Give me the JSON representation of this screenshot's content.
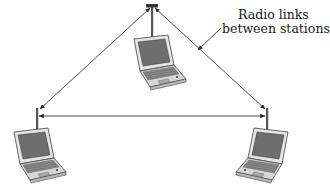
{
  "diagram": {
    "type": "ad-hoc wireless network",
    "callout": {
      "line1": "Radio links",
      "line2": "between stations"
    },
    "nodes": [
      {
        "id": "station-top",
        "label": "",
        "icon": "laptop-with-antenna"
      },
      {
        "id": "station-left",
        "label": "",
        "icon": "laptop-with-antenna"
      },
      {
        "id": "station-right",
        "label": "",
        "icon": "laptop-with-antenna"
      }
    ],
    "edges": [
      {
        "from": "station-top",
        "to": "station-left",
        "style": "double-arrow"
      },
      {
        "from": "station-top",
        "to": "station-right",
        "style": "double-arrow"
      },
      {
        "from": "station-left",
        "to": "station-right",
        "style": "double-arrow"
      }
    ],
    "colors": {
      "line": "#3a3a3a",
      "laptop_body": "#d9d9d9",
      "laptop_screen": "#6e6e6e",
      "laptop_outline": "#444444",
      "text": "#1a1a1a"
    }
  }
}
